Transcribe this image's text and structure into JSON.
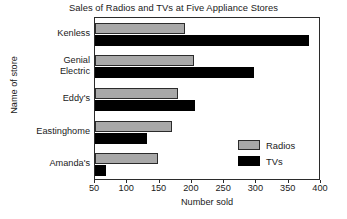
{
  "chart_data": {
    "type": "bar",
    "orientation": "horizontal",
    "title": "Sales of Radios and TVs at Five Appliance Stores",
    "xlabel": "Number sold",
    "ylabel": "Name of store",
    "categories": [
      "Kenless",
      "Genial Electric",
      "Eddy's",
      "Eastinghome",
      "Amanda's"
    ],
    "category_lines": [
      [
        "Kenless"
      ],
      [
        "Genial",
        "Electric"
      ],
      [
        "Eddy's"
      ],
      [
        "Eastinghome"
      ],
      [
        "Amanda's"
      ]
    ],
    "series": [
      {
        "name": "Radios",
        "color": "#a8a8a8",
        "values": [
          190,
          203,
          178,
          169,
          148
        ]
      },
      {
        "name": "TVs",
        "color": "#000000",
        "values": [
          381,
          297,
          205,
          131,
          67
        ]
      }
    ],
    "xlim": [
      50,
      400
    ],
    "xticks": [
      50,
      100,
      150,
      200,
      250,
      300,
      350,
      400
    ],
    "xtick_labels": [
      "50",
      "100",
      "150",
      "200",
      "250",
      "300",
      "350",
      "400"
    ],
    "grid": false,
    "legend_position": "inside-bottom-right",
    "legend_entries": [
      "Radios",
      "TVs"
    ]
  }
}
